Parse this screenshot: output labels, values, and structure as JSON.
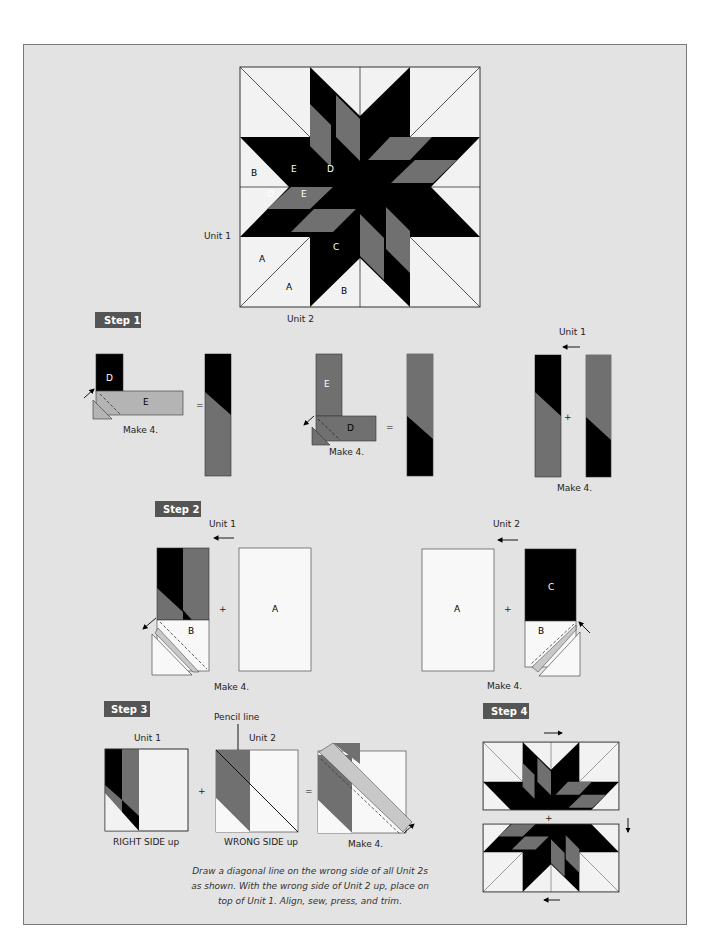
{
  "colors": {
    "panel_bg": "#e3e3e3",
    "panel_border": "#7a7a7a",
    "dark_fabric": "#000000",
    "medium_fabric": "#707070",
    "light_fabric": "#f2f2f2",
    "strip_gray": "#b4b4b4",
    "step_badge": "#555555"
  },
  "main_block": {
    "unit_labels": {
      "unit1": "Unit 1",
      "unit2": "Unit 2"
    },
    "piece_labels": {
      "A1": "A",
      "A2": "A",
      "B1": "B",
      "B2": "B",
      "C": "C",
      "D1": "D",
      "D2": "D",
      "E1": "E",
      "E2": "E"
    }
  },
  "steps": [
    {
      "badge": "Step 1",
      "parts": [
        {
          "pieces": [
            "D",
            "E"
          ],
          "operator": "=",
          "caption": "Make 4."
        },
        {
          "pieces": [
            "E",
            "D"
          ],
          "operator": "=",
          "caption": "Make 4."
        },
        {
          "unit_label": "Unit 1",
          "operator": "+",
          "caption": "Make 4."
        }
      ]
    },
    {
      "badge": "Step 2",
      "parts": [
        {
          "unit_label": "Unit 1",
          "pieces": [
            "B",
            "A"
          ],
          "operator": "+",
          "caption": "Make 4."
        },
        {
          "unit_label": "Unit 2",
          "pieces": [
            "A",
            "C",
            "B"
          ],
          "operator": "+",
          "caption": "Make 4."
        }
      ]
    },
    {
      "badge": "Step 3",
      "parts": [
        {
          "unit_label": "Unit 1",
          "caption": "RIGHT SIDE up",
          "operator": "+"
        },
        {
          "unit_label": "Unit 2",
          "caption": "WRONG SIDE up",
          "callout": "Pencil line",
          "operator": "="
        },
        {
          "caption": "Make 4."
        }
      ],
      "instructions": [
        "Draw a diagonal line on the wrong side of all Unit 2s",
        "as shown. With the wrong side of Unit 2 up, place on",
        "top of Unit 1. Align, sew, press, and trim."
      ]
    },
    {
      "badge": "Step 4",
      "parts": [
        {
          "operator": "+"
        }
      ]
    }
  ]
}
